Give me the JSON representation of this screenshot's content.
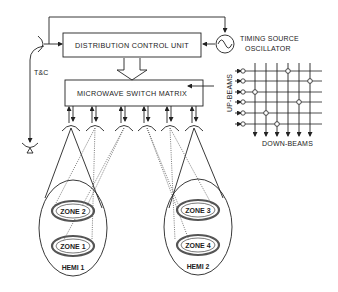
{
  "diagram": {
    "blocks": {
      "distribution_control_unit": "DISTRIBUTION CONTROL UNIT",
      "microwave_switch_matrix": "MICROWAVE SWITCH MATRIX"
    },
    "oscillator": {
      "label_line1": "TIMING SOURCE",
      "label_line2": "OSCILLATOR",
      "symbol": "sine-wave"
    },
    "tc_link": {
      "label": "T&C"
    },
    "switch_matrix_detail": {
      "rows_label": "UP-BEAMS",
      "cols_label": "DOWN-BEAMS",
      "rows": 6,
      "cols": 6,
      "crosspoints": [
        {
          "row": 1,
          "col": 4
        },
        {
          "row": 2,
          "col": 6
        },
        {
          "row": 3,
          "col": 1
        },
        {
          "row": 4,
          "col": 5
        },
        {
          "row": 5,
          "col": 2
        },
        {
          "row": 6,
          "col": 3
        }
      ]
    },
    "antennas": {
      "count": 6
    },
    "coverage": [
      {
        "hemi": "HEMI 1",
        "zones": [
          "ZONE 2",
          "ZONE 1"
        ]
      },
      {
        "hemi": "HEMI 2",
        "zones": [
          "ZONE 3",
          "ZONE 4"
        ]
      }
    ]
  }
}
